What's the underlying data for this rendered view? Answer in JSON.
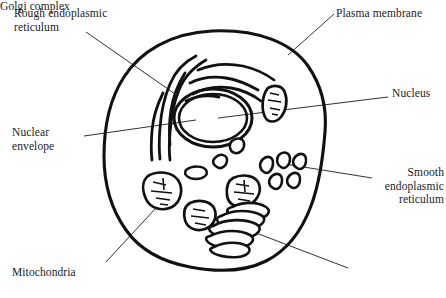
{
  "figure": {
    "type": "biology-diagram",
    "background_color": "#ffffff",
    "ink_color": "#111111",
    "leader_line_color": "#1a1a1a"
  },
  "labels": {
    "rough_er": "Rough endoplasmic\nreticulum",
    "plasma_membrane": "Plasma membrane",
    "nucleus": "Nucleus",
    "nuclear_envelope": "Nuclear\nenvelope",
    "smooth_er": "Smooth\nendoplasmic\nreticulum",
    "mitochondria": "Mitochondria",
    "golgi_complex": "Golgi complex"
  },
  "structures": [
    {
      "id": "plasma-membrane",
      "label": "Plasma membrane",
      "description": "outer boundary of the cell, thick hand-drawn closed curve"
    },
    {
      "id": "nucleus",
      "label": "Nucleus",
      "description": "large oval organelle left of center"
    },
    {
      "id": "nuclear-envelope",
      "label": "Nuclear envelope",
      "description": "double membrane enclosing the nucleus"
    },
    {
      "id": "rough-er",
      "label": "Rough endoplasmic reticulum",
      "description": "wavy branching membranes above and left of the nucleus"
    },
    {
      "id": "smooth-er",
      "label": "Smooth endoplasmic reticulum",
      "description": "small comma shaped vesicles on the right side"
    },
    {
      "id": "mitochondria",
      "label": "Mitochondria",
      "description": "bean shaped organelles with internal cristae"
    },
    {
      "id": "golgi-complex",
      "label": "Golgi complex",
      "description": "stack of flattened sacs lower center right"
    }
  ]
}
